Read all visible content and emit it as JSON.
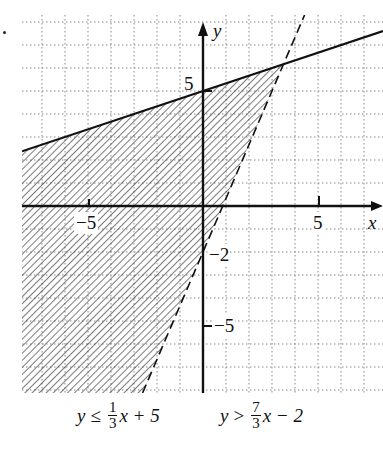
{
  "chart_data": {
    "type": "line",
    "title": "",
    "subtitle": "",
    "xlabel": "x",
    "ylabel": "y",
    "xlim": [
      -8,
      8
    ],
    "ylim": [
      -8,
      8
    ],
    "grid": true,
    "x_tick_labels": [
      "-5",
      "5"
    ],
    "y_tick_labels": [
      "5",
      "-2",
      "-5"
    ],
    "series": [
      {
        "name": "y = (1/3)x + 5",
        "style": "solid",
        "slope": 0.3333,
        "intercept": 5,
        "points": [
          [
            -8,
            2.333
          ],
          [
            8,
            7.667
          ]
        ]
      },
      {
        "name": "y = (7/3)x - 2",
        "style": "dashed",
        "slope": 2.3333,
        "intercept": -2,
        "points": [
          [
            -2.571,
            -8
          ],
          [
            4.286,
            8
          ]
        ]
      }
    ],
    "shaded_region": "y <= (1/3)x + 5 and y > (7/3)x - 2 (hatched, left of dashed line, below solid line)",
    "intersection": [
      3.5,
      6.167
    ],
    "annotations": [
      "y ≤ (1/3)x + 5",
      "y > (7/3)x − 2"
    ]
  },
  "axes": {
    "x_label": "x",
    "y_label": "y",
    "tick_x_neg": "−5",
    "tick_x_pos": "5",
    "tick_y_pos": "5",
    "tick_y_int": "−2",
    "tick_y_neg": "−5"
  },
  "equations": {
    "eq1": {
      "lhs": "y",
      "op": "≤",
      "num": "1",
      "den": "3",
      "rest": "x + 5"
    },
    "eq2": {
      "lhs": "y",
      "op": ">",
      "num": "7",
      "den": "3",
      "rest": "x − 2"
    }
  }
}
